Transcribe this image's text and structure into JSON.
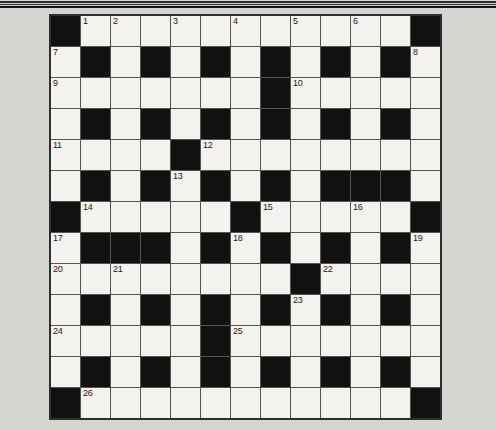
{
  "page": {
    "background_color": "#d6d5d1"
  },
  "masthead_rule": {
    "line_colors": [
      "#2b2b2b",
      "#3c3c3c",
      "#161616"
    ]
  },
  "crossword": {
    "rows": 13,
    "cols": 13,
    "cell_color": "#f3f2ee",
    "black_cell_color": "#111111",
    "grid_line_color": "#555550",
    "outer_border_color": "#2e2e2e",
    "number_color": "#1a1a1a",
    "black_cells": [
      [
        0,
        0
      ],
      [
        0,
        12
      ],
      [
        1,
        1
      ],
      [
        1,
        3
      ],
      [
        1,
        5
      ],
      [
        1,
        7
      ],
      [
        1,
        9
      ],
      [
        1,
        11
      ],
      [
        2,
        7
      ],
      [
        3,
        1
      ],
      [
        3,
        3
      ],
      [
        3,
        5
      ],
      [
        3,
        7
      ],
      [
        3,
        9
      ],
      [
        3,
        11
      ],
      [
        4,
        4
      ],
      [
        5,
        1
      ],
      [
        5,
        3
      ],
      [
        5,
        5
      ],
      [
        5,
        7
      ],
      [
        5,
        9
      ],
      [
        5,
        10
      ],
      [
        5,
        11
      ],
      [
        6,
        0
      ],
      [
        6,
        6
      ],
      [
        6,
        12
      ],
      [
        7,
        1
      ],
      [
        7,
        2
      ],
      [
        7,
        3
      ],
      [
        7,
        5
      ],
      [
        7,
        7
      ],
      [
        7,
        9
      ],
      [
        7,
        11
      ],
      [
        8,
        8
      ],
      [
        9,
        1
      ],
      [
        9,
        3
      ],
      [
        9,
        5
      ],
      [
        9,
        7
      ],
      [
        9,
        9
      ],
      [
        9,
        11
      ],
      [
        10,
        5
      ],
      [
        11,
        1
      ],
      [
        11,
        3
      ],
      [
        11,
        5
      ],
      [
        11,
        7
      ],
      [
        11,
        9
      ],
      [
        11,
        11
      ],
      [
        12,
        0
      ],
      [
        12,
        12
      ]
    ],
    "numbers": [
      {
        "num": "1",
        "row": 0,
        "col": 1
      },
      {
        "num": "2",
        "row": 0,
        "col": 2
      },
      {
        "num": "3",
        "row": 0,
        "col": 4
      },
      {
        "num": "4",
        "row": 0,
        "col": 6
      },
      {
        "num": "5",
        "row": 0,
        "col": 8
      },
      {
        "num": "6",
        "row": 0,
        "col": 10
      },
      {
        "num": "7",
        "row": 1,
        "col": 0
      },
      {
        "num": "8",
        "row": 1,
        "col": 12
      },
      {
        "num": "9",
        "row": 2,
        "col": 0
      },
      {
        "num": "10",
        "row": 2,
        "col": 8
      },
      {
        "num": "11",
        "row": 4,
        "col": 0
      },
      {
        "num": "12",
        "row": 4,
        "col": 5
      },
      {
        "num": "13",
        "row": 5,
        "col": 4
      },
      {
        "num": "14",
        "row": 6,
        "col": 1
      },
      {
        "num": "15",
        "row": 6,
        "col": 7
      },
      {
        "num": "16",
        "row": 6,
        "col": 10
      },
      {
        "num": "17",
        "row": 7,
        "col": 0
      },
      {
        "num": "18",
        "row": 7,
        "col": 6
      },
      {
        "num": "19",
        "row": 7,
        "col": 12
      },
      {
        "num": "20",
        "row": 8,
        "col": 0
      },
      {
        "num": "21",
        "row": 8,
        "col": 2
      },
      {
        "num": "22",
        "row": 8,
        "col": 9
      },
      {
        "num": "23",
        "row": 9,
        "col": 8
      },
      {
        "num": "24",
        "row": 10,
        "col": 0
      },
      {
        "num": "25",
        "row": 10,
        "col": 6
      },
      {
        "num": "26",
        "row": 12,
        "col": 1
      }
    ]
  }
}
